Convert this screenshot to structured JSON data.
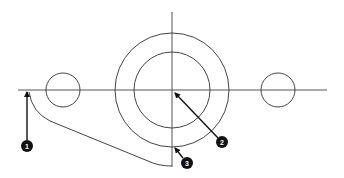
{
  "diagram": {
    "type": "technical-drawing",
    "colors": {
      "background": "#ffffff",
      "line": "#444444",
      "callout_fill": "#111111",
      "callout_text": "#ffffff"
    },
    "centerlines": {
      "horizontal": {
        "x1": 18,
        "y1": 90,
        "x2": 327,
        "y2": 90
      },
      "vertical": {
        "x1": 172,
        "y1": 12,
        "x2": 172,
        "y2": 167
      }
    },
    "circles": [
      {
        "id": "outer-circle",
        "cx": 172,
        "cy": 90,
        "r": 57
      },
      {
        "id": "inner-circle",
        "cx": 172,
        "cy": 90,
        "r": 38
      },
      {
        "id": "left-hole",
        "cx": 63,
        "cy": 90,
        "r": 17
      },
      {
        "id": "right-hole",
        "cx": 278,
        "cy": 90,
        "r": 17
      }
    ],
    "callouts": [
      {
        "number": "1",
        "cx": 27,
        "cy": 145,
        "target_x": 27,
        "target_y": 91
      },
      {
        "number": "2",
        "cx": 222,
        "cy": 142,
        "target_x": 174,
        "target_y": 92
      },
      {
        "number": "3",
        "cx": 187,
        "cy": 163,
        "target_x": 175,
        "target_y": 148
      }
    ]
  }
}
